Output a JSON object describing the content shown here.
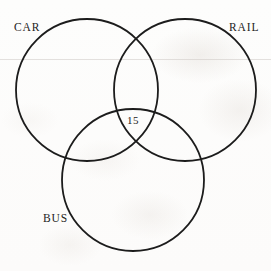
{
  "diagram": {
    "type": "venn-3-circle",
    "title": "",
    "stroke_color": "#1c1c1c",
    "background_color": "#fdfdfc",
    "text_color": "#232323",
    "sets": [
      {
        "id": "car",
        "label": "CAR",
        "cx": 87,
        "cy": 90,
        "r": 71
      },
      {
        "id": "rail",
        "label": "RAIL",
        "cx": 185,
        "cy": 90,
        "r": 71
      },
      {
        "id": "bus",
        "label": "BUS",
        "cx": 133,
        "cy": 180,
        "r": 71
      }
    ],
    "regions": [
      {
        "id": "car-rail-bus",
        "label": "15",
        "value": 15
      }
    ]
  }
}
